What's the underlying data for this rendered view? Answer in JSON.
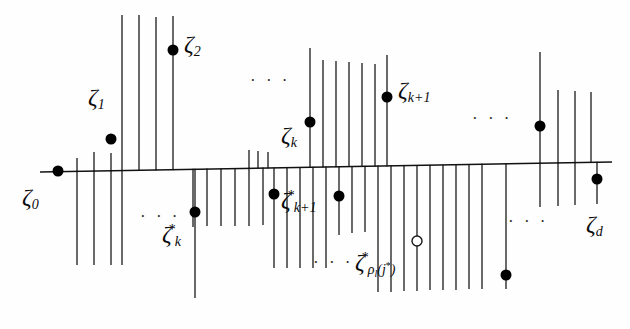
{
  "figure": {
    "type": "mathematical-diagram",
    "axis": {
      "color": "#111111",
      "x_start": 40,
      "x_end": 612,
      "y_start": 172,
      "y_end": 162
    },
    "colors": {
      "line": "#1a1a1a",
      "point_fill": "#000000",
      "point_open_fill": "#ffffff",
      "background": "#fefefe"
    },
    "labels": [
      {
        "id": "zeta-0",
        "zeta": "ζ",
        "sub": "0",
        "sup": "",
        "x": 22,
        "y": 185,
        "size": "normal"
      },
      {
        "id": "zeta-1",
        "zeta": "ζ",
        "sub": "1",
        "sup": "",
        "x": 88,
        "y": 85,
        "size": "normal"
      },
      {
        "id": "zeta-2",
        "zeta": "ζ",
        "sub": "2",
        "sup": "",
        "x": 184,
        "y": 32,
        "size": "normal"
      },
      {
        "id": "zeta-k",
        "zeta": "ζ",
        "sub": "k",
        "sup": "",
        "x": 281,
        "y": 123,
        "size": "normal"
      },
      {
        "id": "zeta-k-plus-1",
        "zeta": "ζ",
        "sub": "k+1",
        "sup": "",
        "x": 398,
        "y": 78,
        "size": "normal"
      },
      {
        "id": "zeta-d",
        "zeta": "ζ",
        "sub": "d",
        "sup": "",
        "x": 586,
        "y": 212,
        "size": "normal"
      },
      {
        "id": "zeta-star-k",
        "zeta": "ζ",
        "sub": "k",
        "sup": "*",
        "x": 162,
        "y": 222,
        "size": "normal"
      },
      {
        "id": "zeta-star-k-plus-1",
        "zeta": "ζ",
        "sub": "k+1",
        "sup": "*",
        "x": 281,
        "y": 188,
        "size": "normal"
      },
      {
        "id": "zeta-star-rho",
        "zeta": "ζ",
        "sub": "",
        "sup": "*",
        "x": 355,
        "y": 250,
        "size": "normal"
      }
    ],
    "rho_label": {
      "zeta": "ζ",
      "sup": "*",
      "rho": "ρ",
      "rho_sub": "l",
      "arg": "(j",
      "arg_sup": "*",
      "arg_close": ")"
    },
    "ellipses": [
      {
        "id": "ellipsis-upper-left",
        "text": "· · ·",
        "x": 250,
        "y": 72
      },
      {
        "id": "ellipsis-upper-right",
        "text": "· · ·",
        "x": 472,
        "y": 110
      },
      {
        "id": "ellipsis-lower-left",
        "text": "· · ·",
        "x": 140,
        "y": 208
      },
      {
        "id": "ellipsis-lower-mid",
        "text": "· · ·",
        "x": 313,
        "y": 254
      },
      {
        "id": "ellipsis-lower-right",
        "text": "· · ·",
        "x": 508,
        "y": 213
      }
    ],
    "ticks_above": [
      {
        "x": 77,
        "top": 158
      },
      {
        "x": 94,
        "top": 152
      },
      {
        "x": 111,
        "top": 153
      },
      {
        "x": 122,
        "top": 15
      },
      {
        "x": 139,
        "top": 15
      },
      {
        "x": 156,
        "top": 17
      },
      {
        "x": 173,
        "top": 16
      },
      {
        "x": 249,
        "top": 150
      },
      {
        "x": 258,
        "top": 151
      },
      {
        "x": 268,
        "top": 152
      },
      {
        "x": 310,
        "top": 48
      },
      {
        "x": 323,
        "top": 60
      },
      {
        "x": 336,
        "top": 61
      },
      {
        "x": 349,
        "top": 62
      },
      {
        "x": 362,
        "top": 63
      },
      {
        "x": 375,
        "top": 64
      },
      {
        "x": 387,
        "top": 55
      },
      {
        "x": 540,
        "top": 52
      },
      {
        "x": 558,
        "top": 90
      },
      {
        "x": 575,
        "top": 91
      },
      {
        "x": 591,
        "top": 92
      }
    ],
    "ticks_below": [
      {
        "x": 77,
        "bottom": 265
      },
      {
        "x": 94,
        "bottom": 265
      },
      {
        "x": 111,
        "bottom": 265
      },
      {
        "x": 122,
        "bottom": 265
      },
      {
        "x": 193,
        "bottom": 227
      },
      {
        "x": 207,
        "bottom": 226
      },
      {
        "x": 221,
        "bottom": 226
      },
      {
        "x": 235,
        "bottom": 226
      },
      {
        "x": 249,
        "bottom": 226
      },
      {
        "x": 263,
        "bottom": 225
      },
      {
        "x": 195,
        "bottom": 298
      },
      {
        "x": 274,
        "bottom": 268
      },
      {
        "x": 287,
        "bottom": 268
      },
      {
        "x": 300,
        "bottom": 268
      },
      {
        "x": 313,
        "bottom": 268
      },
      {
        "x": 326,
        "bottom": 268
      },
      {
        "x": 339,
        "bottom": 235
      },
      {
        "x": 352,
        "bottom": 233
      },
      {
        "x": 365,
        "bottom": 232
      },
      {
        "x": 378,
        "bottom": 292
      },
      {
        "x": 391,
        "bottom": 292
      },
      {
        "x": 404,
        "bottom": 291
      },
      {
        "x": 417,
        "bottom": 291
      },
      {
        "x": 430,
        "bottom": 290
      },
      {
        "x": 443,
        "bottom": 290
      },
      {
        "x": 456,
        "bottom": 290
      },
      {
        "x": 469,
        "bottom": 289
      },
      {
        "x": 482,
        "bottom": 289
      },
      {
        "x": 506,
        "bottom": 289
      },
      {
        "x": 540,
        "bottom": 207
      },
      {
        "x": 558,
        "bottom": 206
      },
      {
        "x": 575,
        "bottom": 205
      },
      {
        "x": 597,
        "bottom": 204
      }
    ],
    "points_filled": [
      {
        "id": "pt-zeta-0",
        "x": 58,
        "y": 171,
        "r": 5.5
      },
      {
        "id": "pt-zeta-1",
        "x": 111,
        "y": 139,
        "r": 5.5
      },
      {
        "id": "pt-zeta-2",
        "x": 173,
        "y": 50,
        "r": 5.5
      },
      {
        "id": "pt-zeta-k",
        "x": 310,
        "y": 122,
        "r": 5.5
      },
      {
        "id": "pt-zeta-k-plus-1",
        "x": 387,
        "y": 97,
        "r": 5.5
      },
      {
        "id": "pt-upper-right",
        "x": 540,
        "y": 126,
        "r": 5.5
      },
      {
        "id": "pt-zeta-d",
        "x": 597,
        "y": 179,
        "r": 5.5
      },
      {
        "id": "pt-zeta-star-k",
        "x": 195,
        "y": 212,
        "r": 5.5
      },
      {
        "id": "pt-zeta-star-k1",
        "x": 274,
        "y": 194,
        "r": 5.5
      },
      {
        "id": "pt-mid-lower",
        "x": 339,
        "y": 196,
        "r": 5.5
      },
      {
        "id": "pt-lower-right",
        "x": 506,
        "y": 275,
        "r": 5.5
      }
    ],
    "points_open": [
      {
        "id": "pt-rho-open",
        "x": 417,
        "y": 241,
        "r": 5
      }
    ]
  }
}
